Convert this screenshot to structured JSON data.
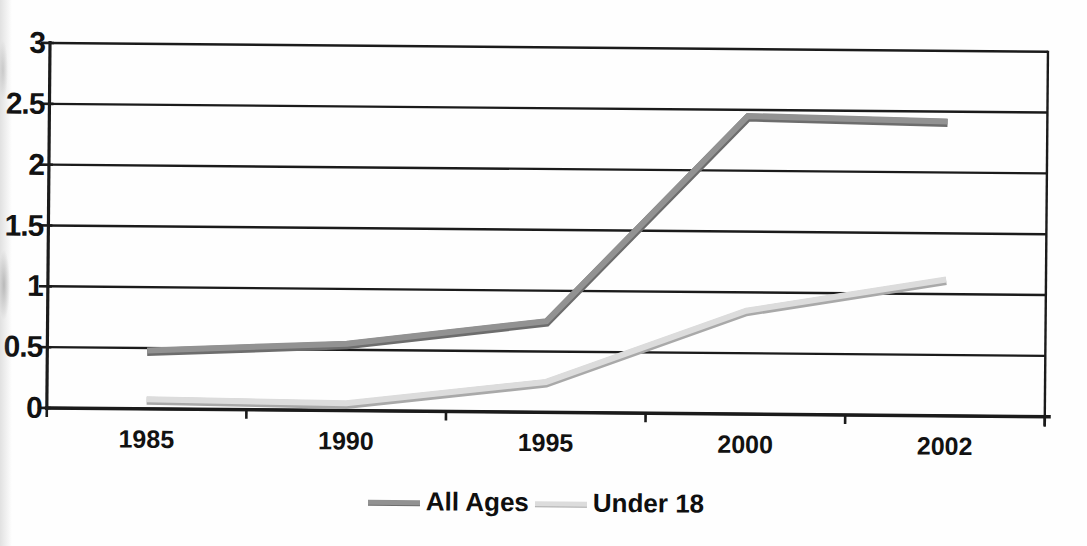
{
  "chart_data": {
    "type": "line",
    "title": "",
    "categories": [
      "1985",
      "1990",
      "1995",
      "2000",
      "2002"
    ],
    "series": [
      {
        "name": "All Ages",
        "values": [
          0.48,
          0.55,
          0.75,
          2.45,
          2.42
        ],
        "color": "#929292",
        "edge_color": "#6d6d6d"
      },
      {
        "name": "Under 18",
        "values": [
          0.08,
          0.06,
          0.25,
          0.85,
          1.12
        ],
        "color": "#dcdcdc",
        "edge_color": "#a9a9a9"
      }
    ],
    "ylim": [
      0,
      3
    ],
    "yticks": [
      0,
      0.5,
      1,
      1.5,
      2,
      2.5,
      3
    ],
    "ytick_labels": [
      "0",
      "0.5",
      "1",
      "1.5",
      "2",
      "2.5",
      "3"
    ],
    "xlabel": "",
    "ylabel": "",
    "grid": "horizontal",
    "legend_position": "bottom",
    "axis_color": "#1b1b1b",
    "text_color": "#121212",
    "background": "#fefefe"
  }
}
